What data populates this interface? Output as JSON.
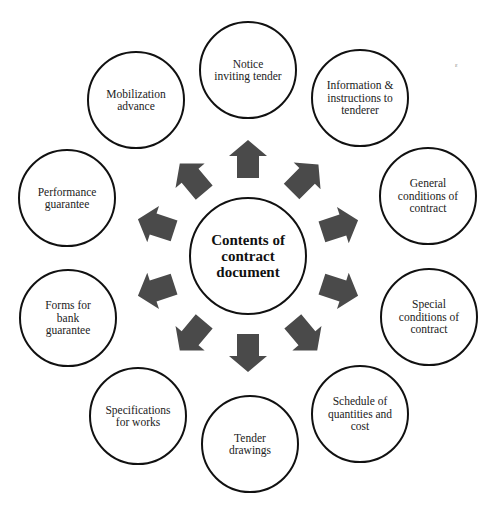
{
  "diagram": {
    "center": {
      "label": "Contents of\ncontract\ndocument",
      "cx": 248,
      "cy": 256,
      "r": 59
    },
    "nodes": [
      {
        "id": "notice",
        "label": "Notice\ninviting tender",
        "cx": 248,
        "cy": 70,
        "r": 49
      },
      {
        "id": "information",
        "label": "Information &\ninstructions to\ntenderer",
        "cx": 360,
        "cy": 98,
        "r": 49
      },
      {
        "id": "general",
        "label": "General\nconditions of\ncontract",
        "cx": 428,
        "cy": 196,
        "r": 49
      },
      {
        "id": "special",
        "label": "Special\nconditions of\ncontract",
        "cx": 429,
        "cy": 317,
        "r": 49
      },
      {
        "id": "schedule",
        "label": "Schedule of\nquantities and\ncost",
        "cx": 360,
        "cy": 414,
        "r": 49
      },
      {
        "id": "tender-drawings",
        "label": "Tender\ndrawings",
        "cx": 250,
        "cy": 444,
        "r": 49
      },
      {
        "id": "specifications",
        "label": "Specifications\nfor works",
        "cx": 138,
        "cy": 416,
        "r": 49
      },
      {
        "id": "forms",
        "label": "Forms for\nbank\nguarantee",
        "cx": 68,
        "cy": 318,
        "r": 49
      },
      {
        "id": "performance",
        "label": "Performance\nguarantee",
        "cx": 67,
        "cy": 198,
        "r": 49
      },
      {
        "id": "mobilization",
        "label": "Mobilization\nadvance",
        "cx": 136,
        "cy": 100,
        "r": 49
      }
    ],
    "arrows": [
      {
        "target": "notice",
        "x": 248,
        "y": 159,
        "angle": -90
      },
      {
        "target": "information",
        "x": 305,
        "y": 178,
        "angle": -45
      },
      {
        "target": "general",
        "x": 340,
        "y": 226,
        "angle": -18
      },
      {
        "target": "special",
        "x": 340,
        "y": 290,
        "angle": 18
      },
      {
        "target": "schedule",
        "x": 305,
        "y": 336,
        "angle": 50
      },
      {
        "target": "tender-drawings",
        "x": 248,
        "y": 353,
        "angle": 90
      },
      {
        "target": "specifications",
        "x": 192,
        "y": 336,
        "angle": 130
      },
      {
        "target": "forms",
        "x": 156,
        "y": 290,
        "angle": 162
      },
      {
        "target": "performance",
        "x": 156,
        "y": 225,
        "angle": -162
      },
      {
        "target": "mobilization",
        "x": 192,
        "y": 178,
        "angle": -130
      }
    ],
    "colors": {
      "arrow": "#4a4a4a",
      "border": "#111111",
      "text": "#222222",
      "background": "#ffffff"
    },
    "stray_mark": {
      "text": "ε",
      "x": 455,
      "y": 62
    }
  }
}
